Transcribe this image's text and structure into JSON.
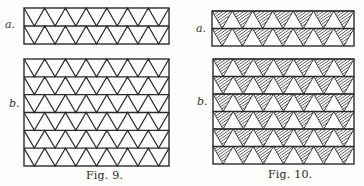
{
  "colors": {
    "ink": "#2b2b2b",
    "paper": "#fdfdfb",
    "hatch": "#3a3a3a"
  },
  "figures": [
    {
      "id": "fig9",
      "caption": "Fig. 9.",
      "caption_pos": [
        86,
        169
      ],
      "style": "outline",
      "panels": [
        {
          "label": "a.",
          "label_pos": [
            5,
            18
          ],
          "x": 24,
          "y": 8,
          "w": 145,
          "h": 36,
          "rows": 2,
          "triangles_per_row": 7
        },
        {
          "label": "b.",
          "label_pos": [
            9,
            97
          ],
          "x": 24,
          "y": 59,
          "w": 145,
          "h": 107,
          "rows": 6,
          "triangles_per_row": 7
        }
      ]
    },
    {
      "id": "fig10",
      "caption": "Fig. 10.",
      "caption_pos": [
        268,
        168
      ],
      "style": "hatched",
      "panels": [
        {
          "label": "a.",
          "label_pos": [
            196,
            22
          ],
          "x": 212,
          "y": 11,
          "w": 142,
          "h": 35,
          "rows": 2,
          "triangles_per_row": 7
        },
        {
          "label": "b.",
          "label_pos": [
            197,
            95
          ],
          "x": 213,
          "y": 59,
          "w": 141,
          "h": 105,
          "rows": 6,
          "triangles_per_row": 7
        }
      ]
    }
  ]
}
